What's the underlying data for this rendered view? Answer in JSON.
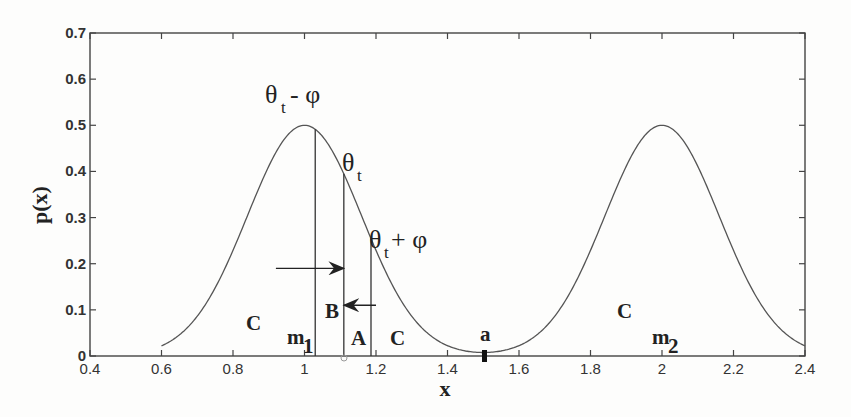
{
  "chart_data": {
    "type": "line",
    "title": "",
    "xlabel": "x",
    "ylabel": "p(x)",
    "xlim": [
      0.4,
      2.4
    ],
    "ylim": [
      0,
      0.7
    ],
    "x_ticks": [
      "0.4",
      "0.6",
      "0.8",
      "1",
      "1.2",
      "1.4",
      "1.6",
      "1.8",
      "2",
      "2.2",
      "2.4"
    ],
    "y_ticks": [
      "0",
      "0.1",
      "0.2",
      "0.3",
      "0.4",
      "0.5",
      "0.6",
      "0.7"
    ],
    "grid": false,
    "series": [
      {
        "name": "p(x)",
        "description": "Mixture of two Gaussian bumps, means m1=1 and m2=2, peak height 0.5, sigma about 0.16",
        "x": [
          0.4,
          0.6,
          0.7,
          0.8,
          0.9,
          1.0,
          1.1,
          1.2,
          1.3,
          1.4,
          1.5,
          1.6,
          1.7,
          1.8,
          1.9,
          2.0,
          2.1,
          2.2,
          2.3,
          2.4
        ],
        "y": [
          0.0,
          0.02,
          0.086,
          0.231,
          0.411,
          0.5,
          0.411,
          0.231,
          0.086,
          0.02,
          0.004,
          0.02,
          0.086,
          0.231,
          0.411,
          0.5,
          0.411,
          0.231,
          0.086,
          0.02
        ]
      }
    ],
    "vertical_lines": [
      {
        "label": "θt - φ",
        "x": 1.03
      },
      {
        "label": "θt",
        "x": 1.11
      },
      {
        "label": "θt + φ",
        "x": 1.186
      }
    ],
    "annotations": [
      {
        "text": "m1",
        "x": 0.99,
        "y": 0.03
      },
      {
        "text": "m2",
        "x": 2.0,
        "y": 0.03
      },
      {
        "text": "B",
        "x": 1.07,
        "y": 0.06
      },
      {
        "text": "A",
        "x": 1.15,
        "y": 0.03
      },
      {
        "text": "C",
        "x": 0.85,
        "y": 0.1
      },
      {
        "text": "C",
        "x": 1.22,
        "y": 0.03
      },
      {
        "text": "C",
        "x": 1.89,
        "y": 0.06
      },
      {
        "text": "a",
        "x": 1.5,
        "y": 0.025
      },
      {
        "text": "arrow right",
        "from_x": 0.92,
        "to_x": 1.11,
        "y": 0.19
      },
      {
        "text": "arrow left",
        "from_x": 1.2,
        "to_x": 1.11,
        "y": 0.11
      }
    ],
    "legend": null
  },
  "labels": {
    "ylabel": "p(x)",
    "xlabel": "x",
    "theta_minus": {
      "main": "θ",
      "sub": "t",
      "rest": " - φ"
    },
    "theta": {
      "main": "θ",
      "sub": "t"
    },
    "theta_plus": {
      "main": "θ",
      "sub": "t",
      "rest": " + φ"
    },
    "m1": {
      "main": "m",
      "sub": "1"
    },
    "m2": {
      "main": "m",
      "sub": "2"
    },
    "A": "A",
    "B": "B",
    "C": "C",
    "a": "a"
  }
}
